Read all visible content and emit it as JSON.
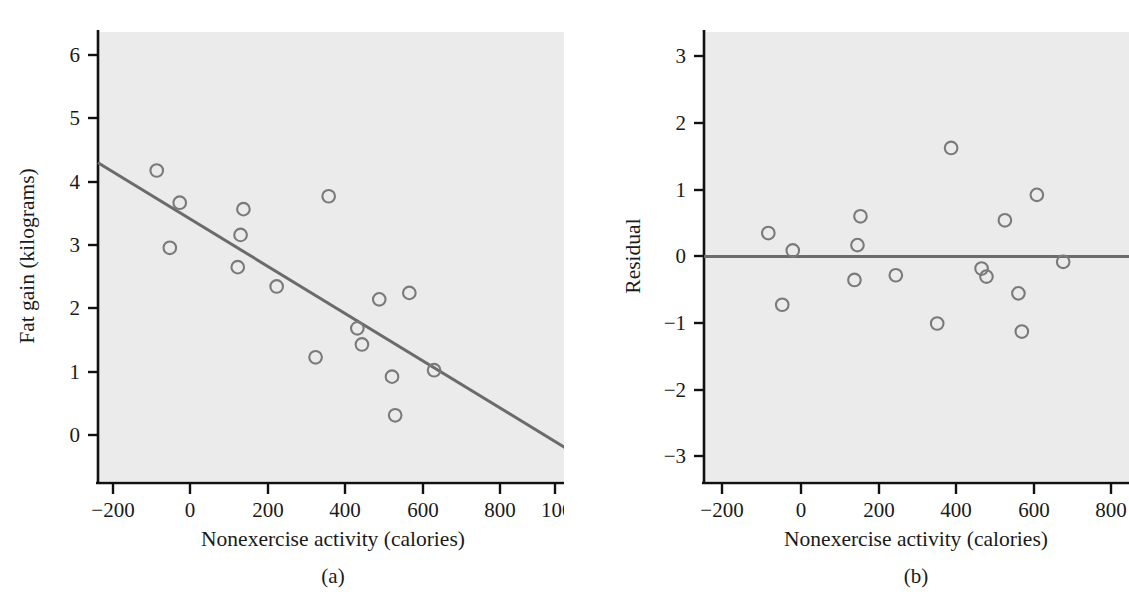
{
  "figure": {
    "panel_a_label": "(a)",
    "panel_b_label": "(b)"
  },
  "chart_data": [
    {
      "type": "scatter",
      "id": "panel-a",
      "title": "",
      "xlabel": "Nonexercise activity (calories)",
      "ylabel": "Fat gain (kilograms)",
      "xlim": [
        -260,
        1060
      ],
      "ylim": [
        -0.62,
        6.35
      ],
      "xticks": [
        -200,
        0,
        200,
        400,
        600,
        800,
        1000
      ],
      "xticklabels": [
        "−200",
        "0",
        "200",
        "400",
        "600",
        "800",
        "1000"
      ],
      "yticks": [
        0,
        1,
        2,
        3,
        4,
        5,
        6
      ],
      "yticklabels": [
        "0",
        "1",
        "2",
        "3",
        "4",
        "5",
        "6"
      ],
      "grid": false,
      "legend": "none",
      "x": [
        -94,
        -57,
        -29,
        135,
        143,
        151,
        245,
        355,
        392,
        473,
        486,
        535,
        571,
        580,
        620,
        690
      ],
      "y": [
        4.2,
        3.0,
        3.7,
        2.7,
        3.2,
        3.6,
        2.4,
        1.3,
        3.8,
        1.75,
        1.5,
        2.2,
        1.0,
        0.4,
        2.3,
        1.1
      ],
      "fit_line": {
        "label": "least-squares regression line",
        "x": [
          -260,
          1060
        ],
        "y": [
          4.32,
          -0.1
        ]
      }
    },
    {
      "type": "scatter",
      "id": "panel-b",
      "title": "",
      "xlabel": "Nonexercise activity (calories)",
      "ylabel": "Residual",
      "xlim": [
        -265,
        865
      ],
      "ylim": [
        -3.35,
        3.35
      ],
      "xticks": [
        -200,
        0,
        200,
        400,
        600,
        800
      ],
      "xticklabels": [
        "−200",
        "0",
        "200",
        "400",
        "600",
        "800"
      ],
      "yticks": [
        -3,
        -2,
        -1,
        0,
        1,
        2,
        3
      ],
      "yticklabels": [
        "−3",
        "−2",
        "−1",
        "0",
        "1",
        "2",
        "3"
      ],
      "grid": false,
      "legend": "none",
      "x": [
        -94,
        -57,
        -29,
        135,
        143,
        151,
        245,
        355,
        392,
        473,
        486,
        535,
        571,
        580,
        620,
        690
      ],
      "y": [
        0.35,
        -0.72,
        0.09,
        -0.35,
        0.17,
        0.6,
        -0.28,
        -1.0,
        1.62,
        -0.18,
        -0.3,
        0.54,
        -0.55,
        -1.12,
        0.92,
        -0.08
      ],
      "zero_line": {
        "label": "residual zero reference line",
        "y": 0
      }
    }
  ],
  "colors": {
    "plot_background": "#ebebeb",
    "axis": "#111111",
    "marker_stroke": "#7a7a7a",
    "line": "#6b6b6b",
    "page_background": "#ffffff"
  }
}
